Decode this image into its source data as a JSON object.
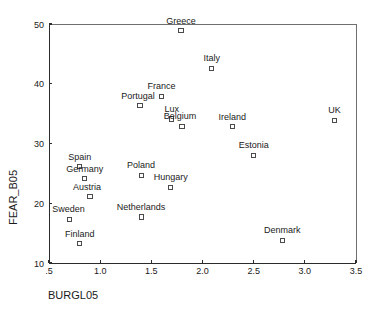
{
  "chart_data": {
    "type": "scatter",
    "title": "",
    "xlabel": "BURGL05",
    "ylabel": "FEAR_B05",
    "xlim": [
      0.5,
      3.5
    ],
    "ylim": [
      10,
      50
    ],
    "xticks": [
      ".5",
      "1.0",
      "1.5",
      "2.0",
      "2.5",
      "3.0",
      "3.5"
    ],
    "xtick_values": [
      0.5,
      1.0,
      1.5,
      2.0,
      2.5,
      3.0,
      3.5
    ],
    "yticks": [
      "10",
      "20",
      "30",
      "40",
      "50"
    ],
    "ytick_values": [
      10,
      20,
      30,
      40,
      50
    ],
    "grid": false,
    "legend": "none",
    "points": [
      {
        "label": "Greece",
        "x": 1.79,
        "y": 48.9,
        "label_dx": 0,
        "label_dy": -7
      },
      {
        "label": "Italy",
        "x": 2.09,
        "y": 42.6,
        "label_dx": 0,
        "label_dy": -7
      },
      {
        "label": "France",
        "x": 1.6,
        "y": 37.9,
        "label_dx": 0,
        "label_dy": -7
      },
      {
        "label": "Portugal",
        "x": 1.39,
        "y": 36.3,
        "label_dx": -2,
        "label_dy": -7
      },
      {
        "label": "Lux",
        "x": 1.7,
        "y": 34.1,
        "label_dx": 0,
        "label_dy": -7
      },
      {
        "label": "Belgium",
        "x": 1.8,
        "y": 32.9,
        "label_dx": -2,
        "label_dy": -7
      },
      {
        "label": "Ireland",
        "x": 2.29,
        "y": 32.8,
        "label_dx": 0,
        "label_dy": -7
      },
      {
        "label": "UK",
        "x": 3.29,
        "y": 33.9,
        "label_dx": 0,
        "label_dy": -7
      },
      {
        "label": "Estonia",
        "x": 2.5,
        "y": 28.0,
        "label_dx": 0,
        "label_dy": -7
      },
      {
        "label": "Spain",
        "x": 0.8,
        "y": 26.1,
        "label_dx": 0,
        "label_dy": -7
      },
      {
        "label": "Poland",
        "x": 1.4,
        "y": 24.7,
        "label_dx": 0,
        "label_dy": -7
      },
      {
        "label": "Germany",
        "x": 0.85,
        "y": 24.1,
        "label_dx": 0,
        "label_dy": -7
      },
      {
        "label": "Hungary",
        "x": 1.69,
        "y": 22.7,
        "label_dx": 0,
        "label_dy": -7
      },
      {
        "label": "Austria",
        "x": 0.9,
        "y": 21.1,
        "label_dx": -3,
        "label_dy": -7
      },
      {
        "label": "Netherlands",
        "x": 1.4,
        "y": 17.7,
        "label_dx": 0,
        "label_dy": -7
      },
      {
        "label": "Sweden",
        "x": 0.7,
        "y": 17.3,
        "label_dx": -1,
        "label_dy": -7
      },
      {
        "label": "Denmark",
        "x": 2.78,
        "y": 13.8,
        "label_dx": 0,
        "label_dy": -7
      },
      {
        "label": "Finland",
        "x": 0.8,
        "y": 13.2,
        "label_dx": 0,
        "label_dy": -7
      }
    ]
  }
}
